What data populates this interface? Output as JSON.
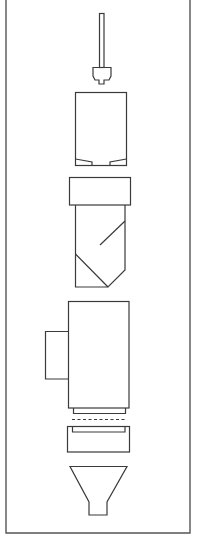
{
  "diagram": {
    "type": "exploded-assembly",
    "orientation": "vertical",
    "line_color": "#3a3a3a",
    "frame_color": "#555555",
    "background": "#ffffff",
    "components": [
      {
        "id": "plunger",
        "label": "",
        "description": "rod with trapezoid tip"
      },
      {
        "id": "upper-chamber",
        "label": "",
        "description": "rectangular housing with two bottom wedges"
      },
      {
        "id": "cartridge",
        "label": "",
        "description": "capped body with diagonal bottom and inner diagonal line"
      },
      {
        "id": "main-body",
        "label": "",
        "description": "large housing with side box and bottom flange"
      },
      {
        "id": "separator",
        "label": "",
        "description": "dashed line"
      },
      {
        "id": "tray",
        "label": "",
        "description": "shallow tray with inner rim"
      },
      {
        "id": "funnel",
        "label": "",
        "description": "funnel with spout"
      }
    ]
  }
}
